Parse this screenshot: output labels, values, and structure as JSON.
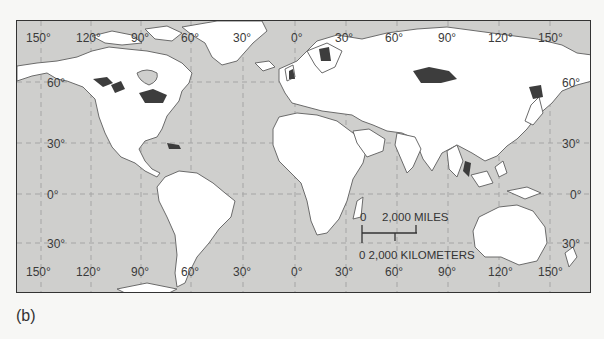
{
  "figure": {
    "caption": "(b)",
    "colors": {
      "ocean": "#cfcfcd",
      "land": "#ffffff",
      "coastline": "#6b6b6b",
      "highlight_regions": "#3d3d3d",
      "grid": "#a5a5a5",
      "frame": "#333333"
    }
  },
  "map": {
    "top_longitude_labels": [
      "150°",
      "120°",
      "90°",
      "60°",
      "30°",
      "0°",
      "30°",
      "60°",
      "90°",
      "120°",
      "150°"
    ],
    "bottom_longitude_labels": [
      "150°",
      "120°",
      "90°",
      "60°",
      "30°",
      "0°",
      "30°",
      "60°",
      "90°",
      "120°",
      "150°"
    ],
    "left_latitude_labels": [
      "60°",
      "30°",
      "0°",
      "30°"
    ],
    "right_latitude_labels": [
      "60°",
      "30°",
      "0°",
      "30°"
    ],
    "scale_bar": {
      "miles_zero": "0",
      "miles_label": "2,000 MILES",
      "km_label": "0 2,000 KILOMETERS"
    }
  }
}
